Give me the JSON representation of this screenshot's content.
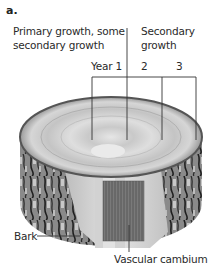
{
  "figure": {
    "panel_label": "a.",
    "title_left": [
      "Primary growth, some",
      "secondary growth"
    ],
    "title_right": [
      "Secondary",
      "growth"
    ],
    "year_labels": [
      "Year 1",
      "2",
      "3"
    ],
    "callouts": {
      "bark": "Bark",
      "vascular_cambium": "Vascular cambium"
    }
  },
  "colors": {
    "background": "#ffffff",
    "line": "#333333",
    "wood_light": "#d9d9d9",
    "wood_mid": "#bdbdbd",
    "bark_dark": "#3a3a3a",
    "cambium": "#6e6e6e"
  }
}
